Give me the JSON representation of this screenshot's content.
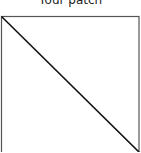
{
  "title": "Your patch",
  "patch": {
    "frame": {
      "x": 1.5,
      "y": 16.5,
      "width": 137.5,
      "height": 140,
      "stroke": "#555555"
    },
    "diagonal": {
      "x1": 1.5,
      "y1": 16.5,
      "x2": 139,
      "y2": 152,
      "stroke": "#111111"
    }
  }
}
